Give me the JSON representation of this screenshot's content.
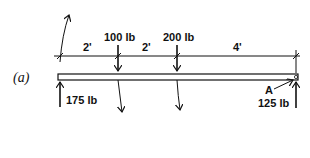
{
  "figure_label": "(a)",
  "beam": {
    "dimensions": [
      "2'",
      "2'",
      "4'"
    ],
    "loads": [
      {
        "label": "100 lb",
        "direction": "down"
      },
      {
        "label": "200 lb",
        "direction": "down"
      }
    ],
    "reactions": [
      {
        "label": "175 lb",
        "direction": "up",
        "position": "left"
      },
      {
        "label": "125 lb",
        "direction": "up",
        "position": "right"
      }
    ],
    "point_label": "A"
  }
}
